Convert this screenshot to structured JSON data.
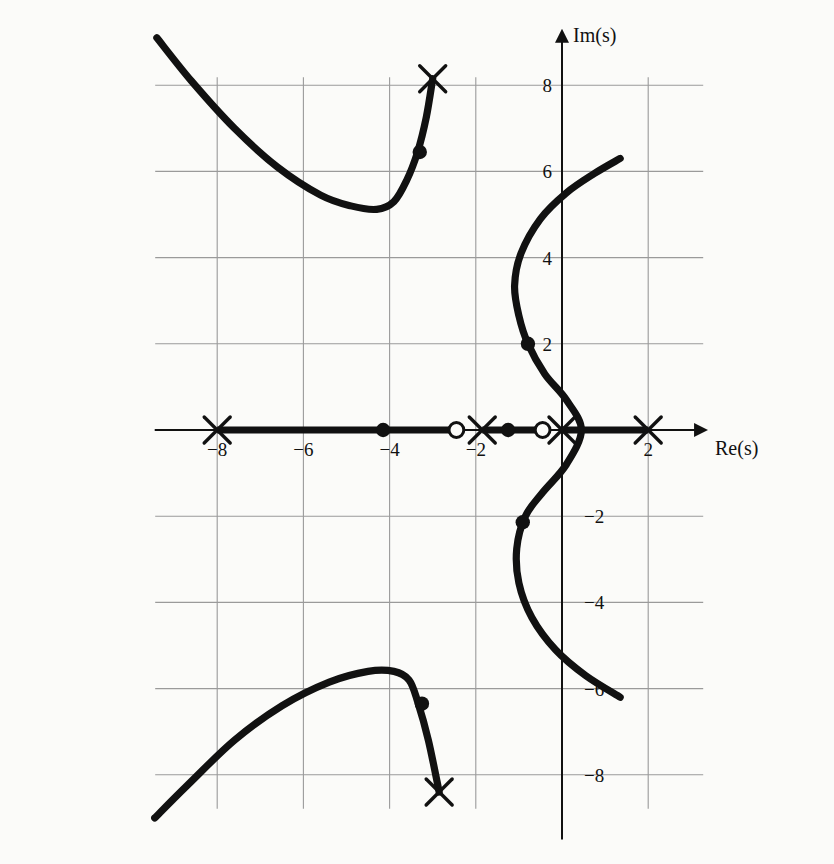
{
  "figure": {
    "kind": "root-locus",
    "background_color": "#fbfbf9",
    "ink_color": "#111111",
    "grid_color": "#9a9a9a",
    "axis_label_x": "Re(s)",
    "axis_label_y": "Im(s)"
  },
  "axes": {
    "x_ticks": [
      {
        "value": -8,
        "label": "−8"
      },
      {
        "value": -6,
        "label": "−6"
      },
      {
        "value": -4,
        "label": "−4"
      },
      {
        "value": -2,
        "label": "−2"
      },
      {
        "value": 2,
        "label": "2"
      }
    ],
    "y_ticks": [
      {
        "value": 8,
        "label": "8"
      },
      {
        "value": 6,
        "label": "6"
      },
      {
        "value": 4,
        "label": "4"
      },
      {
        "value": 2,
        "label": "2"
      },
      {
        "value": -2,
        "label": "−2"
      },
      {
        "value": -4,
        "label": "−4"
      },
      {
        "value": -6,
        "label": "−6"
      },
      {
        "value": -8,
        "label": "−8"
      }
    ],
    "xlim": [
      -9.5,
      4.0
    ],
    "ylim": [
      -9.5,
      9.6
    ],
    "grid": true,
    "grid_step": 2
  },
  "chart_data": {
    "type": "scatter",
    "title": "",
    "xlabel": "Re(s)",
    "ylabel": "Im(s)",
    "xlim": [
      -9.5,
      4.0
    ],
    "ylim": [
      -9.5,
      9.6
    ],
    "poles": [
      {
        "re": -8.0,
        "im": 0.0,
        "marker": "x"
      },
      {
        "re": -1.85,
        "im": 0.0,
        "marker": "x"
      },
      {
        "re": 0.0,
        "im": 0.0,
        "marker": "x"
      },
      {
        "re": 2.0,
        "im": 0.0,
        "marker": "x"
      },
      {
        "re": -3.0,
        "im": 8.15,
        "marker": "x"
      },
      {
        "re": -2.85,
        "im": -8.4,
        "marker": "x"
      }
    ],
    "zeros": [
      {
        "re": -2.45,
        "im": 0.0,
        "marker": "o"
      },
      {
        "re": -0.45,
        "im": 0.0,
        "marker": "o"
      }
    ],
    "gain_points": [
      {
        "re": -4.15,
        "im": 0.0,
        "marker": "dot"
      },
      {
        "re": -1.25,
        "im": 0.0,
        "marker": "dot"
      },
      {
        "re": -3.3,
        "im": 6.45,
        "marker": "dot"
      },
      {
        "re": -3.25,
        "im": -6.35,
        "marker": "dot"
      },
      {
        "re": -0.79,
        "im": 2.0,
        "marker": "dot"
      },
      {
        "re": -0.91,
        "im": -2.14,
        "marker": "dot"
      }
    ],
    "real_axis_segments": [
      {
        "from": -8.0,
        "to": -2.45
      },
      {
        "from": -1.85,
        "to": -0.45
      },
      {
        "from": 0.0,
        "to": 2.0
      }
    ],
    "branches": [
      {
        "name": "upper-left-branch",
        "points": [
          [
            -9.4,
            9.1
          ],
          [
            -8.6,
            8.1
          ],
          [
            -7.6,
            7.0
          ],
          [
            -6.6,
            6.1
          ],
          [
            -5.6,
            5.45
          ],
          [
            -4.9,
            5.2
          ],
          [
            -4.3,
            5.12
          ],
          [
            -3.9,
            5.3
          ],
          [
            -3.6,
            5.8
          ],
          [
            -3.35,
            6.45
          ],
          [
            -3.15,
            7.25
          ],
          [
            -3.0,
            8.15
          ]
        ]
      },
      {
        "name": "lower-left-branch",
        "points": [
          [
            -9.45,
            -9.0
          ],
          [
            -8.7,
            -8.25
          ],
          [
            -7.6,
            -7.2
          ],
          [
            -6.5,
            -6.4
          ],
          [
            -5.4,
            -5.85
          ],
          [
            -4.5,
            -5.6
          ],
          [
            -3.9,
            -5.6
          ],
          [
            -3.55,
            -5.8
          ],
          [
            -3.35,
            -6.3
          ],
          [
            -3.1,
            -7.2
          ],
          [
            -2.85,
            -8.4
          ]
        ]
      },
      {
        "name": "right-sweep-branch",
        "points": [
          [
            1.35,
            6.3
          ],
          [
            0.75,
            5.95
          ],
          [
            0.1,
            5.5
          ],
          [
            -0.5,
            4.9
          ],
          [
            -0.95,
            4.1
          ],
          [
            -1.1,
            3.35
          ],
          [
            -1.0,
            2.65
          ],
          [
            -0.79,
            2.0
          ],
          [
            -0.4,
            1.3
          ],
          [
            0.1,
            0.7
          ],
          [
            0.45,
            0.0
          ],
          [
            0.1,
            -0.8
          ],
          [
            -0.45,
            -1.45
          ],
          [
            -0.85,
            -2.0
          ],
          [
            -1.05,
            -2.75
          ],
          [
            -1.0,
            -3.55
          ],
          [
            -0.7,
            -4.35
          ],
          [
            -0.15,
            -5.1
          ],
          [
            0.55,
            -5.7
          ],
          [
            1.35,
            -6.2
          ]
        ]
      }
    ]
  },
  "markers": {
    "pole_glyph": "x",
    "zero_glyph": "o",
    "gain_glyph": "dot"
  }
}
